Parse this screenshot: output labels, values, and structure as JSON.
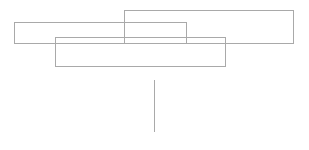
{
  "canvas": {
    "width": 309,
    "height": 150,
    "background_color": "#ffffff",
    "title": "Overlapping Rectangles Wireframe"
  },
  "style": {
    "stroke_color": "#a9a9a9",
    "stroke_color_secondary": "#b0b0b0",
    "stroke_width": 1,
    "fill": "none"
  },
  "shapes": [
    {
      "id": "rect-1",
      "name": "wide-upper-left-rectangle",
      "type": "rectangle",
      "x": 14,
      "y": 22,
      "width": 172,
      "height": 21,
      "stroke": "#a9a9a9",
      "stroke_width": 1,
      "fill": "none"
    },
    {
      "id": "rect-2",
      "name": "upper-right-rectangle",
      "type": "rectangle",
      "x": 124,
      "y": 10,
      "width": 169,
      "height": 33,
      "stroke": "#a9a9a9",
      "stroke_width": 1,
      "fill": "none"
    },
    {
      "id": "rect-3",
      "name": "lower-center-rectangle",
      "type": "rectangle",
      "x": 55,
      "y": 37,
      "width": 170,
      "height": 29,
      "stroke": "#a9a9a9",
      "stroke_width": 1,
      "fill": "none"
    }
  ],
  "connector": {
    "id": "line-1",
    "name": "vertical-connector-line",
    "type": "line",
    "x1": 154,
    "y1": 80,
    "x2": 154,
    "y2": 132,
    "stroke": "#a9a9a9",
    "stroke_width": 1
  }
}
